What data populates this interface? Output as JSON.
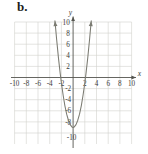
{
  "figure": {
    "label": "b.",
    "background_color": "#ffffff"
  },
  "axes": {
    "x_axis_name": "x",
    "y_axis_name": "y",
    "x_tick_labels": [
      "-10",
      "-8",
      "-6",
      "-4",
      "-2",
      "2",
      "4",
      "6",
      "8",
      "10"
    ],
    "y_tick_labels": [
      "10",
      "8",
      "6",
      "4",
      "2",
      "-2",
      "-4",
      "-6",
      "-8",
      "-10"
    ],
    "axis_color": "#55554f",
    "grid_color": "#d2d2cc"
  },
  "chart_data": {
    "type": "line",
    "title": "b.",
    "xlabel": "x",
    "ylabel": "y",
    "xlim": [
      -11,
      11
    ],
    "ylim": [
      -11,
      11
    ],
    "grid": true,
    "legend": "none",
    "curve_color": "#7b7b72",
    "x_ticks": [
      -10,
      -8,
      -6,
      -4,
      -2,
      2,
      4,
      6,
      8,
      10
    ],
    "y_ticks": [
      10,
      8,
      6,
      4,
      2,
      -2,
      -4,
      -6,
      -8,
      -10
    ],
    "series": [
      {
        "name": "parabola",
        "equation": "y = 2x^2 - 9",
        "vertex": [
          0,
          -9
        ],
        "opens": "up",
        "x_intercepts": [
          -2.12,
          2.12
        ],
        "y_intercept": -9,
        "arrow_ends": [
          [
            -3.1,
            10.5
          ],
          [
            3.1,
            10.5
          ]
        ],
        "x": [
          -3.1,
          -2.8,
          -2.5,
          -2.2,
          -2.0,
          -1.7,
          -1.4,
          -1.1,
          -0.8,
          -0.5,
          -0.2,
          0,
          0.2,
          0.5,
          0.8,
          1.1,
          1.4,
          1.7,
          2.0,
          2.2,
          2.5,
          2.8,
          3.1
        ],
        "y": [
          10.2,
          6.7,
          3.5,
          0.7,
          -1.0,
          -3.2,
          -5.1,
          -6.6,
          -7.7,
          -8.5,
          -8.9,
          -9.0,
          -8.9,
          -8.5,
          -7.7,
          -6.6,
          -5.1,
          -3.2,
          -1.0,
          0.7,
          3.5,
          6.7,
          10.2
        ]
      }
    ]
  }
}
